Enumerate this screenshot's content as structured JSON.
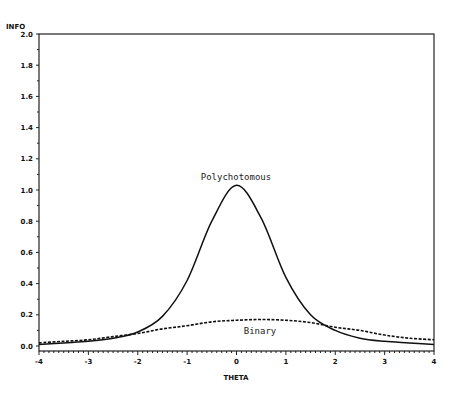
{
  "chart_data": {
    "type": "line",
    "title": "",
    "xlabel": "THETA",
    "ylabel": "INFO",
    "xlim": [
      -4,
      4
    ],
    "ylim": [
      0,
      2.0
    ],
    "grid": false,
    "legend": "none (inline annotations)",
    "x_ticks": [
      "-4",
      "-3",
      "-2",
      "-1",
      "0",
      "1",
      "2",
      "3",
      "4"
    ],
    "y_ticks": [
      "0.0",
      "0.2",
      "0.4",
      "0.6",
      "0.8",
      "1.0",
      "1.2",
      "1.4",
      "1.6",
      "1.8",
      "2.0"
    ],
    "x": [
      -4,
      -3.5,
      -3,
      -2.5,
      -2,
      -1.5,
      -1,
      -0.5,
      0,
      0.5,
      1,
      1.5,
      2,
      2.5,
      3,
      3.5,
      4
    ],
    "series": [
      {
        "name": "Polychotomous",
        "style": "solid",
        "values": [
          0.01,
          0.02,
          0.03,
          0.05,
          0.09,
          0.19,
          0.42,
          0.8,
          1.03,
          0.82,
          0.44,
          0.2,
          0.1,
          0.05,
          0.03,
          0.02,
          0.01
        ]
      },
      {
        "name": "Binary",
        "style": "dashed",
        "values": [
          0.02,
          0.03,
          0.04,
          0.06,
          0.08,
          0.11,
          0.13,
          0.155,
          0.165,
          0.17,
          0.165,
          0.15,
          0.12,
          0.1,
          0.07,
          0.05,
          0.04
        ]
      }
    ],
    "annotations": [
      {
        "text": "Polychotomous",
        "x": 0,
        "y": 1.18
      },
      {
        "text": "Binary",
        "x": 0.5,
        "y": 0.07
      }
    ]
  },
  "labels": {
    "y_axis_title": "INFO",
    "x_axis_title": "THETA",
    "poly_label": "Polychotomous",
    "binary_label": "Binary"
  }
}
